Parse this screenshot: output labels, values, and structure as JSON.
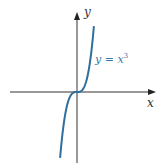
{
  "chart_data": {
    "type": "line",
    "title": "",
    "function": "y = x^3",
    "series": [
      {
        "name": "y = x³",
        "x": [
          -1.3,
          -1,
          -0.5,
          0,
          0.5,
          1,
          1.3
        ],
        "y": [
          -2.197,
          -1,
          -0.125,
          0,
          0.125,
          1,
          2.197
        ]
      }
    ],
    "xlabel": "x",
    "ylabel": "y",
    "annotations": [
      "y = x³"
    ],
    "grid": false,
    "ticks": false,
    "colors": {
      "curve": "#2e6f9e",
      "axes": "#333333"
    }
  },
  "labels": {
    "y_axis": "y",
    "x_axis": "x",
    "curve": "y = x",
    "curve_exp": "3"
  }
}
